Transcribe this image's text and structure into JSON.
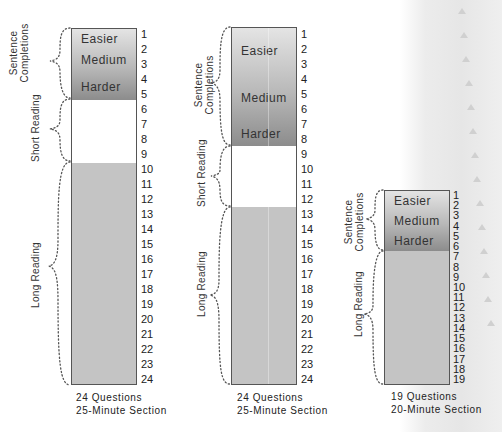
{
  "diagram": {
    "type": "test-section-structure",
    "columns": [
      {
        "id": "col1",
        "total_questions": 24,
        "footer_line1": "24 Questions",
        "footer_line2": "25-Minute Section",
        "sections": [
          {
            "label": "Sentence Completions",
            "line1": "Sentence",
            "line2": "Completions",
            "from": 1,
            "to": 5
          },
          {
            "label": "Short Reading",
            "line1": "Short Reading",
            "from": 6,
            "to": 9
          },
          {
            "label": "Long Reading",
            "line1": "Long Reading",
            "from": 10,
            "to": 24
          }
        ],
        "difficulty": [
          "Easier",
          "Medium",
          "Harder"
        ],
        "numbers": [
          "1",
          "2",
          "3",
          "4",
          "5",
          "6",
          "7",
          "8",
          "9",
          "10",
          "11",
          "12",
          "13",
          "14",
          "15",
          "16",
          "17",
          "18",
          "19",
          "20",
          "21",
          "22",
          "23",
          "24"
        ]
      },
      {
        "id": "col2",
        "total_questions": 24,
        "footer_line1": "24 Questions",
        "footer_line2": "25-Minute Section",
        "sections": [
          {
            "label": "Sentence Completions",
            "line1": "Sentence",
            "line2": "Completions",
            "from": 1,
            "to": 8
          },
          {
            "label": "Short Reading",
            "line1": "Short Reading",
            "from": 9,
            "to": 12
          },
          {
            "label": "Long Reading",
            "line1": "Long Reading",
            "from": 13,
            "to": 24
          }
        ],
        "difficulty": [
          "Easier",
          "Medium",
          "Harder"
        ],
        "numbers": [
          "1",
          "2",
          "3",
          "4",
          "5",
          "6",
          "7",
          "8",
          "9",
          "10",
          "11",
          "12",
          "13",
          "14",
          "15",
          "16",
          "17",
          "18",
          "19",
          "20",
          "21",
          "22",
          "23",
          "24"
        ]
      },
      {
        "id": "col3",
        "total_questions": 19,
        "footer_line1": "19 Questions",
        "footer_line2": "20-Minute Section",
        "sections": [
          {
            "label": "Sentence Completions",
            "line1": "Sentence",
            "line2": "Completions",
            "from": 1,
            "to": 6
          },
          {
            "label": "Long Reading",
            "line1": "Long Reading",
            "from": 7,
            "to": 19
          }
        ],
        "difficulty": [
          "Easier",
          "Medium",
          "Harder"
        ],
        "numbers": [
          "1",
          "2",
          "3",
          "4",
          "5",
          "6",
          "7",
          "8",
          "9",
          "10",
          "11",
          "12",
          "13",
          "14",
          "15",
          "16",
          "17",
          "18",
          "19"
        ]
      }
    ],
    "colors": {
      "sentence_top": "#e4e4e4",
      "sentence_bottom": "#8c8c8c",
      "short_reading": "#ffffff",
      "long_reading": "#c4c4c4",
      "border": "#555555"
    }
  }
}
